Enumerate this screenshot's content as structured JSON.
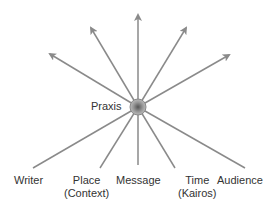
{
  "center": {
    "label": "Praxis"
  },
  "bottom_labels": [
    {
      "line1": "Writer",
      "line2": ""
    },
    {
      "line1": "Place",
      "line2": "(Context)"
    },
    {
      "line1": "Message",
      "line2": ""
    },
    {
      "line1": "Time",
      "line2": "(Kairos)"
    },
    {
      "line1": "Audience",
      "line2": ""
    }
  ],
  "colors": {
    "line": "#8a8a8a",
    "text": "#333333"
  }
}
